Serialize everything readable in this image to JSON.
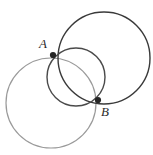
{
  "figure": {
    "width": 153,
    "height": 155,
    "background_color": "#ffffff"
  },
  "labels": {
    "point_a": "A",
    "point_b": "B"
  },
  "colors": {
    "dark_stroke": "#3a3a3a",
    "mid_stroke": "#4a4a4a",
    "light_stroke": "#9a9a9a",
    "point_fill": "#262626",
    "label_fill": "#2b2b2b"
  },
  "chart_data": {
    "type": "scatter",
    "xlabel": "",
    "ylabel": "",
    "xlim": [
      0,
      153
    ],
    "ylim": [
      0,
      155
    ],
    "grid": false,
    "legend": "none",
    "shapes": [
      {
        "name": "large-circle-top-right",
        "kind": "circle",
        "cx": 104,
        "cy": 58,
        "r": 46,
        "stroke": "#3a3a3a",
        "stroke_width": 1.4
      },
      {
        "name": "small-circle-middle",
        "kind": "circle",
        "cx": 76,
        "cy": 77,
        "r": 29,
        "stroke": "#4a4a4a",
        "stroke_width": 1.4
      },
      {
        "name": "large-circle-bottom-left",
        "kind": "circle",
        "cx": 51,
        "cy": 103,
        "r": 45,
        "stroke": "#9a9a9a",
        "stroke_width": 1.2
      }
    ],
    "points": [
      {
        "name": "A",
        "x": 53,
        "y": 55,
        "r": 3.1,
        "fill": "#262626",
        "label": "A",
        "label_x": 43,
        "label_y": 48
      },
      {
        "name": "B",
        "x": 98,
        "y": 100,
        "r": 3.1,
        "fill": "#262626",
        "label": "B",
        "label_x": 105,
        "label_y": 116
      }
    ]
  }
}
